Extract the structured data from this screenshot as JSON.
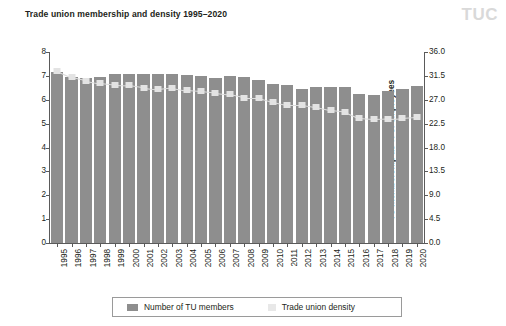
{
  "header": {
    "title": "Trade union membership and density 1995–2020",
    "logo": "TUC"
  },
  "legend": {
    "members_label": "Number of TU members",
    "density_label": "Trade union density"
  },
  "colors": {
    "bar": "#8e8e8e",
    "density_marker": "#e3e3e3",
    "axis": "#5a5a5a",
    "logo": "#d9d9d9",
    "text": "#231f20"
  },
  "chart_data": {
    "type": "bar",
    "title": "Trade union membership and density 1995–2020",
    "xlabel": "",
    "ylabel": "Number of trade union members (millions)",
    "y2label": "TU membership as % of employees",
    "ylim": [
      0,
      8
    ],
    "y2lim": [
      0,
      36
    ],
    "yticks": [
      "0",
      "1",
      "2",
      "3",
      "4",
      "5",
      "6",
      "7",
      "8"
    ],
    "ytick_values": [
      0,
      1,
      2,
      3,
      4,
      5,
      6,
      7,
      8
    ],
    "y2ticks": [
      "0.0",
      "4.5",
      "9.0",
      "13.5",
      "18.0",
      "22.5",
      "27.0",
      "31.5",
      "36.0"
    ],
    "y2tick_values": [
      0,
      4.5,
      9,
      13.5,
      18,
      22.5,
      27,
      31.5,
      36
    ],
    "grid": false,
    "legend_position": "bottom",
    "categories": [
      "1995",
      "1996",
      "1997",
      "1998",
      "1999",
      "2000",
      "2001",
      "2002",
      "2003",
      "2004",
      "2005",
      "2006",
      "2007",
      "2008",
      "2009",
      "2010",
      "2011",
      "2012",
      "2013",
      "2014",
      "2015",
      "2016",
      "2017",
      "2018",
      "2019",
      "2020"
    ],
    "series": [
      {
        "name": "Number of TU members",
        "axis": "left",
        "units": "millions",
        "values": [
          7.15,
          6.95,
          6.9,
          6.97,
          7.08,
          7.1,
          7.06,
          7.06,
          7.09,
          7.05,
          6.99,
          6.93,
          6.99,
          6.97,
          6.81,
          6.67,
          6.62,
          6.47,
          6.52,
          6.52,
          6.53,
          6.23,
          6.21,
          6.35,
          6.44,
          6.56
        ]
      },
      {
        "name": "Trade union density",
        "axis": "right",
        "units": "% of employees",
        "values": [
          32.4,
          31.2,
          30.6,
          30.1,
          29.8,
          29.7,
          29.3,
          29.0,
          29.3,
          28.8,
          28.6,
          28.3,
          28.0,
          27.4,
          27.4,
          26.6,
          26.0,
          26.0,
          25.6,
          25.0,
          24.7,
          23.5,
          23.3,
          23.4,
          23.5,
          23.7
        ]
      }
    ]
  }
}
